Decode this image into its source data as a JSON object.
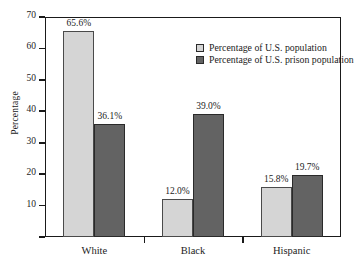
{
  "chart_data": {
    "type": "bar",
    "title": "",
    "subtitle": "",
    "xlabel": "",
    "ylabel": "Percentage",
    "categories": [
      "White",
      "Black",
      "Hispanic"
    ],
    "series": [
      {
        "name": "Percentage of U.S. population",
        "color": "#d5d5d5",
        "values": [
          65.6,
          12.0,
          15.8
        ],
        "labels": [
          "65.6%",
          "12.0%",
          "15.8%"
        ]
      },
      {
        "name": "Percentage of U.S. prison population",
        "color": "#636363",
        "values": [
          36.1,
          39.0,
          19.7
        ],
        "labels": [
          "36.1%",
          "39.0%",
          "19.7%"
        ]
      }
    ],
    "ylim": [
      0,
      70
    ],
    "yticks": [
      10,
      20,
      30,
      40,
      50,
      60,
      70
    ],
    "ytick_labels": [
      "10",
      "20",
      "30",
      "40",
      "50",
      "60",
      "70"
    ],
    "grid": false,
    "legend_position": "top-center-inside",
    "frame": "box"
  },
  "axes": {
    "y_title": "Percentage",
    "y_tick_labels": [
      "70",
      "60",
      "50",
      "40",
      "30",
      "20",
      "10"
    ],
    "x_tick_labels": [
      "White",
      "Black",
      "Hispanic"
    ]
  },
  "legend": {
    "items": [
      {
        "label": "Percentage of U.S. population",
        "swatch": "light-gray-swatch"
      },
      {
        "label": "Percentage of U.S. prison population",
        "swatch": "dark-gray-swatch"
      }
    ]
  },
  "bar_labels": {
    "white_population": "65.6%",
    "white_prison": "36.1%",
    "black_population": "12.0%",
    "black_prison": "39.0%",
    "hispanic_population": "15.8%",
    "hispanic_prison": "19.7%"
  },
  "colors": {
    "series_light": "#d5d5d5",
    "series_dark": "#636363",
    "axis": "#1a1a1a",
    "background": "#ffffff",
    "text": "#1c1c1c"
  }
}
